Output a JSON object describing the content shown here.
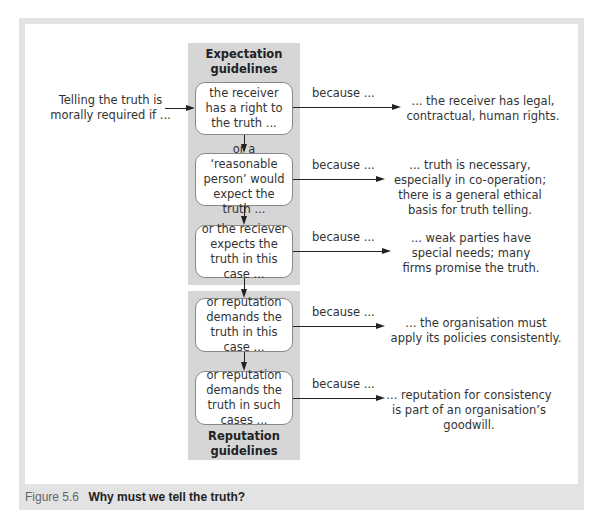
{
  "figure": {
    "number": "Figure 5.6",
    "title": "Why must we tell the truth?"
  },
  "intro": {
    "text": "Telling the truth is morally required if ..."
  },
  "panels": {
    "expectation": {
      "label": "Expectation guidelines"
    },
    "reputation": {
      "label": "Reputation guidelines"
    }
  },
  "rows": [
    {
      "condition": "the receiver has a right to the truth ...",
      "connector": "because ...",
      "reason": "... the receiver has legal, contractual, human rights."
    },
    {
      "condition": "or a ‘reasonable person’ would expect the truth ...",
      "connector": "because ...",
      "reason": "... truth is necessary, especially in co-operation; there is a general ethical basis for truth telling."
    },
    {
      "condition": "or the reciever expects the truth in this case ...",
      "connector": "because ...",
      "reason": "... weak parties have special needs; many firms promise the truth."
    },
    {
      "condition": "or reputation demands the truth in this case ...",
      "connector": "because ...",
      "reason": "... the organisation must apply its policies consistently."
    },
    {
      "condition": "or reputation demands the truth in such cases ...",
      "connector": "because ...",
      "reason": "... reputation for consistency is part of an organisation’s goodwill."
    }
  ],
  "colors": {
    "frame": "#e3e3e3",
    "panel": "#d6d6d6",
    "box_border": "#888888",
    "arrow": "#222222"
  }
}
